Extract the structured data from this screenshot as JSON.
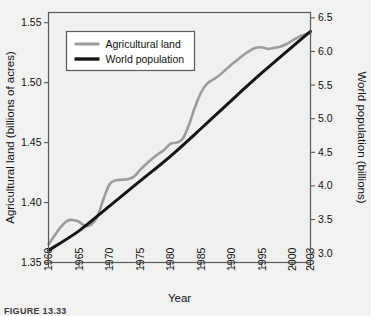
{
  "figure": {
    "caption": "FIGURE  13.33"
  },
  "chart_data": {
    "type": "line",
    "title": "",
    "xlabel": "Year",
    "ylabel": "Agricultural land (billions of acres)",
    "y2label": "World population (billions)",
    "grid": false,
    "legend_position": "upper-left-inside",
    "xlim": [
      1960,
      2003
    ],
    "xticks": [
      1960,
      1965,
      1970,
      1975,
      1980,
      1985,
      1990,
      1995,
      2000,
      2003
    ],
    "xticklabels": [
      "1960",
      "1965",
      "1970",
      "1975",
      "1980",
      "1985",
      "1990",
      "1995",
      "2000",
      "2003"
    ],
    "ylim": [
      1.35,
      1.5585
    ],
    "yticks": [
      1.35,
      1.4,
      1.45,
      1.5,
      1.55
    ],
    "yticklabels": [
      "1.35",
      "1.40",
      "1.45",
      "1.50",
      "1.55"
    ],
    "y2lim": [
      2.86,
      6.58
    ],
    "y2ticks": [
      3.0,
      3.5,
      4.0,
      4.5,
      5.0,
      5.5,
      6.0,
      6.5
    ],
    "y2ticklabels": [
      "3.0",
      "3.5",
      "4.0",
      "4.5",
      "5.0",
      "5.5",
      "6.0",
      "6.5"
    ],
    "colors": {
      "agricultural_land": "#9c9c9c",
      "world_population": "#151515",
      "plot_background": "#f0f0f0",
      "page_background": "#f2f2f2",
      "frame": "#5a5a5a"
    },
    "series": [
      {
        "name": "Agricultural land",
        "axis": "left",
        "color": "#9c9c9c",
        "x": [
          1960,
          1961,
          1962,
          1963,
          1964,
          1965,
          1966,
          1967,
          1968,
          1969,
          1970,
          1971,
          1972,
          1973,
          1974,
          1975,
          1976,
          1977,
          1978,
          1979,
          1980,
          1981,
          1982,
          1983,
          1984,
          1985,
          1986,
          1987,
          1988,
          1989,
          1990,
          1991,
          1992,
          1993,
          1994,
          1995,
          1996,
          1997,
          1998,
          1999,
          2000,
          2001,
          2002,
          2003
        ],
        "y": [
          1.365,
          1.3725,
          1.3795,
          1.3845,
          1.3855,
          1.384,
          1.3805,
          1.3815,
          1.388,
          1.4025,
          1.415,
          1.4185,
          1.419,
          1.4195,
          1.4215,
          1.427,
          1.432,
          1.4365,
          1.4405,
          1.444,
          1.449,
          1.45,
          1.453,
          1.464,
          1.479,
          1.4915,
          1.499,
          1.5025,
          1.506,
          1.5105,
          1.515,
          1.519,
          1.523,
          1.5265,
          1.529,
          1.5295,
          1.5282,
          1.529,
          1.53,
          1.532,
          1.535,
          1.538,
          1.54,
          1.5415
        ]
      },
      {
        "name": "World population",
        "axis": "right",
        "color": "#151515",
        "x": [
          1960,
          1965,
          1970,
          1975,
          1980,
          1985,
          1990,
          1995,
          2000,
          2003
        ],
        "y": [
          3.04,
          3.33,
          3.7,
          4.07,
          4.44,
          4.85,
          5.27,
          5.68,
          6.07,
          6.3
        ]
      }
    ],
    "legend": [
      {
        "label": "Agricultural land",
        "color": "#9c9c9c"
      },
      {
        "label": "World population",
        "color": "#151515"
      }
    ]
  }
}
